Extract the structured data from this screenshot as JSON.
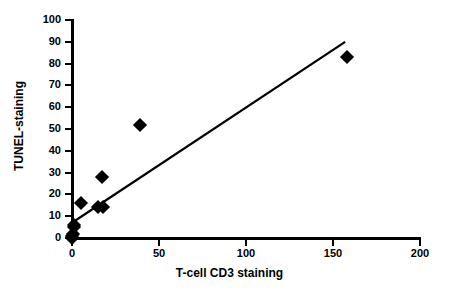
{
  "chart_data": {
    "type": "scatter",
    "title": "",
    "xlabel": "T-cell CD3 staining",
    "ylabel": "TUNEL-staining",
    "xlim": [
      0,
      200
    ],
    "ylim": [
      0,
      100
    ],
    "xticks": [
      0,
      50,
      100,
      150,
      200
    ],
    "yticks": [
      0,
      10,
      20,
      30,
      40,
      50,
      60,
      70,
      80,
      90,
      100
    ],
    "xtick_labels": [
      "0",
      "50",
      "100",
      "150",
      "200"
    ],
    "ytick_labels": [
      "0",
      "10",
      "20",
      "30",
      "40",
      "50",
      "60",
      "70",
      "80",
      "90",
      "100"
    ],
    "grid": false,
    "legend": null,
    "marker": "filled-diamond",
    "marker_color": "#000000",
    "series": [
      {
        "name": "samples",
        "points": [
          {
            "x": 0,
            "y": 0
          },
          {
            "x": 0,
            "y": 1
          },
          {
            "x": 0.5,
            "y": 2
          },
          {
            "x": 1,
            "y": 5
          },
          {
            "x": 1,
            "y": 6
          },
          {
            "x": 5,
            "y": 16
          },
          {
            "x": 15,
            "y": 14
          },
          {
            "x": 18,
            "y": 14
          },
          {
            "x": 17,
            "y": 28
          },
          {
            "x": 39,
            "y": 52
          },
          {
            "x": 158,
            "y": 83
          }
        ]
      }
    ],
    "trendline": {
      "type": "linear-fit",
      "color": "#000000",
      "x_start": 0,
      "y_start": 7,
      "x_end": 157,
      "y_end": 90
    }
  }
}
